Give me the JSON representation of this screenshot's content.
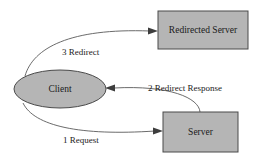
{
  "diagram": {
    "background_color": "#ffffff",
    "node_fill_color": "#b5b5b5",
    "node_stroke_color": "#4a4a4a",
    "edge_color": "#5a5a5a",
    "text_color": "#1a1a1a",
    "nodes": [
      {
        "id": "client",
        "label": "Client",
        "shape": "ellipse",
        "cx": 60,
        "cy": 89,
        "rx": 46,
        "ry": 19
      },
      {
        "id": "redirected-server",
        "label": "Redirected Server",
        "shape": "rectangle",
        "x": 158,
        "y": 11,
        "width": 90,
        "height": 38
      },
      {
        "id": "server",
        "label": "Server",
        "shape": "rectangle",
        "x": 163,
        "y": 112,
        "width": 75,
        "height": 40
      }
    ],
    "edges": [
      {
        "id": "edge-1-request",
        "label": "1 Request",
        "from": "client",
        "to": "server",
        "label_x": 63,
        "label_y": 141,
        "order": 1
      },
      {
        "id": "edge-2-redirect-response",
        "label": "2 Redirect Response",
        "from": "server",
        "to": "client",
        "label_x": 148,
        "label_y": 89,
        "order": 2
      },
      {
        "id": "edge-3-redirect",
        "label": "3 Redirect",
        "from": "client",
        "to": "redirected-server",
        "label_x": 91,
        "label_y": 53,
        "order": 3
      }
    ]
  }
}
